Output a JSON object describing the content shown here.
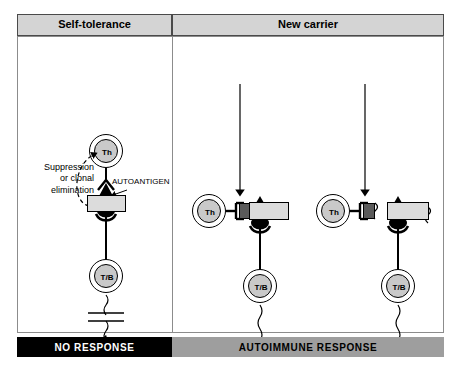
{
  "figure": {
    "header": {
      "self_tolerance": "Self-tolerance",
      "new_carrier": "New carrier",
      "columns": [
        {
          "label": "ABNORMAL SELF-ANTIGEN"
        },
        {
          "label": "CROSS-REACTING ANTIGEN"
        },
        {
          "label": "DRUG"
        },
        {
          "label": "VIRUS"
        }
      ],
      "groups": [
        {
          "label": "INTRAMOLECULAR"
        },
        {
          "label": "MEMBRANE-ASSOCIATED"
        }
      ]
    },
    "panels": {
      "self_tolerance": {
        "suppression_label": "Suppression\nor clonal\nelimination",
        "autoantigen_label": "AUTOANTIGEN",
        "helper_cell": "Th",
        "effector_cell": "T/B"
      },
      "intramolecular": {
        "helper_cell": "Th",
        "effector_cell": "T/B"
      },
      "membrane_associated": {
        "helper_cell": "Th",
        "effector_cell": "T/B"
      }
    },
    "outcomes": {
      "no_response": "NO RESPONSE",
      "autoimmune_response": "AUTOIMMUNE RESPONSE"
    },
    "colors": {
      "header_top_bg": "#d4d4d4",
      "header_mid_bg": "#f0f0f0",
      "header_bottom_bg": "#cfcfcf",
      "no_response_bg": "#000000",
      "autoimmune_bg": "#9e9e9e",
      "cell_fill": "#c9c9c9",
      "mhc_fill": "#dcdcdc",
      "carrier_fill": "#5a5a5a"
    }
  }
}
